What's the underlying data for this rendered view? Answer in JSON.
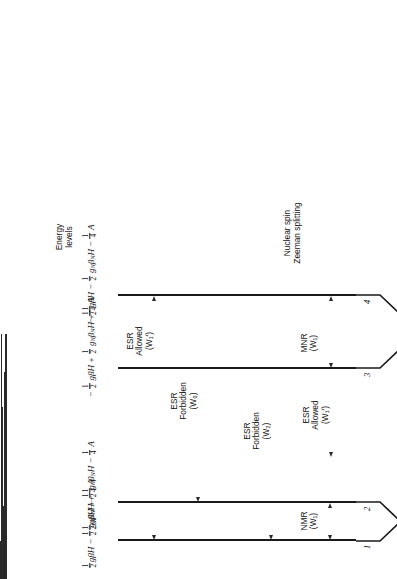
{
  "figure": {
    "caption_number": "Fig. 12-1.",
    "caption_text": "Energy level diagram of the ESR two-spin (½, ½) system showing the six relaxation rates Wᵢ"
  },
  "axis_labels": {
    "energy_levels": "Energy\nlevels",
    "nuclear_spin": "Nuclear spin\nZeeman splitting",
    "hyperfine": "Hyperfine\nsplitting",
    "electron_spin": "Electron spin\nZeeman splitting"
  },
  "levels": [
    {
      "index": "1",
      "energy_html": "<frac>1/2</frac><i>gβH</i> − <frac>1/2</frac> <i>g<sub>N</sub>β<sub>N</sub>H</i> + <frac>1/4</frac> <i>A</i>",
      "energy_text": "½gβH − ½g_Nβ_NH + ¼A",
      "mI": "m_I = ½",
      "mS": "m_S = +½"
    },
    {
      "index": "2",
      "energy_html": "<frac>1/2</frac><i>gβH</i> + <frac>1/2</frac> <i>g<sub>N</sub>β<sub>N</sub>H</i> − <frac>1/4</frac> <i>A</i>",
      "energy_text": "½gβH + ½g_Nβ_NH − ¼A",
      "mI": "m_I = −½",
      "mS": "m_S = +½"
    },
    {
      "index": "3",
      "energy_html": "− <frac>1/2</frac> <i>gβH</i> + <frac>1/2</frac> <i>g<sub>N</sub>β<sub>N</sub>H</i> + <frac>1/4</frac> <i>A</i>",
      "energy_text": "−½gβH + ½g_Nβ_NH + ¼A",
      "mI": "m_I = −½",
      "mS": "m_S = −½"
    },
    {
      "index": "4",
      "energy_html": "− <frac>1/2</frac> <i>gβH</i> − <frac>1/2</frac> <i>g<sub>N</sub>β<sub>N</sub>H</i> − <frac>1/4</frac> <i>A</i>",
      "energy_text": "−½gβH − ½g_Nβ_NH − ¼A",
      "mI": "m_I = ½",
      "mS": "m_S = −½"
    }
  ],
  "transitions": [
    {
      "id": "nmr-w1",
      "line1": "NMR",
      "line2": "",
      "rate": "(W₁)"
    },
    {
      "id": "esr-forbidden-w2",
      "line1": "ESR",
      "line2": "Forbidden",
      "rate": "(W₂)"
    },
    {
      "id": "esr-allowed-w1p",
      "line1": "ESR",
      "line2": "Allowed",
      "rate": "(W₁′)"
    },
    {
      "id": "mnr-w1",
      "line1": "MNR",
      "line2": "",
      "rate": "(W₁)"
    },
    {
      "id": "esr-forbidden-w0",
      "line1": "ESR",
      "line2": "Forbidden",
      "rate": "(W₀)"
    },
    {
      "id": "esr-allowed-w1p2",
      "line1": "ESR",
      "line2": "Allowed",
      "rate": "(W₁′)"
    }
  ],
  "colors": {
    "ink": "#111111",
    "line": "#2a2a2a",
    "background": "#ffffff"
  }
}
